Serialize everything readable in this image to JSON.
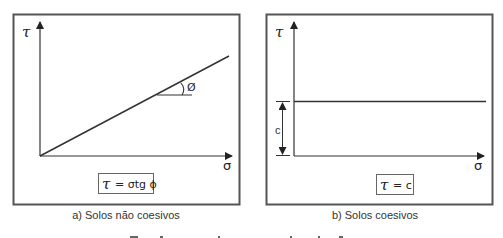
{
  "panels": [
    {
      "id": "a",
      "y_axis_label": "τ",
      "x_axis_label": "σ",
      "angle_label": "Ø",
      "formula": "τ = σtg ϕ",
      "formula_tau": "τ",
      "formula_rest": "= σtg ϕ",
      "caption": "a) Solos não coesivos"
    },
    {
      "id": "b",
      "y_axis_label": "τ",
      "x_axis_label": "σ",
      "cohesion_label": "c",
      "formula": "τ = c",
      "formula_tau": "τ",
      "formula_rest": "= c",
      "caption": "b) Solos coesivos"
    }
  ],
  "colors": {
    "stroke": "#333333",
    "frame": "#555555",
    "background": "#ffffff"
  }
}
